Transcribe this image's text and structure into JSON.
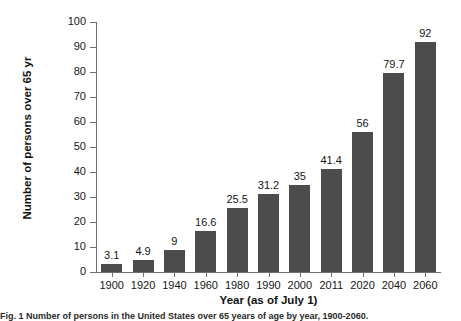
{
  "chart_data": {
    "type": "bar",
    "title": "",
    "xlabel": "Year (as of July 1)",
    "ylabel": "Number of persons over 65 yr",
    "categories": [
      "1900",
      "1920",
      "1940",
      "1960",
      "1980",
      "1990",
      "2000",
      "2011",
      "2020",
      "2040",
      "2060"
    ],
    "values": [
      3.1,
      4.9,
      9,
      16.6,
      25.5,
      31.2,
      35,
      41.4,
      56,
      79.7,
      92
    ],
    "value_labels": [
      "3.1",
      "4.9",
      "9",
      "16.6",
      "25.5",
      "31.2",
      "35",
      "41.4",
      "56",
      "79.7",
      "92"
    ],
    "ylim": [
      0,
      100
    ],
    "ytick_labels": [
      "0",
      "10",
      "20",
      "30",
      "40",
      "50",
      "60",
      "70",
      "80",
      "90",
      "100"
    ],
    "yticks": [
      0,
      10,
      20,
      30,
      40,
      50,
      60,
      70,
      80,
      90,
      100
    ],
    "grid": false,
    "legend": "none",
    "bar_color": "#4c4c4c",
    "axis_color": "#6f6f6f",
    "background_color": "#ffffff"
  },
  "caption": {
    "text": "Fig. 1 Number of persons in the United States over 65 years of age by year, 1900-2060."
  }
}
